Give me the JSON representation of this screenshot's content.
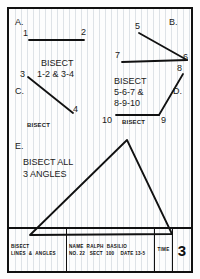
{
  "sheet": {
    "title": "Bisect Lines & Angles Worksheet",
    "grid_color": "#96a5b4",
    "ink_color": "#111111"
  },
  "sections": {
    "a": {
      "letter": "A.",
      "point_start": "1",
      "point_end": "2",
      "line": {
        "x1": 20,
        "y1": 31,
        "x2": 75,
        "y2": 31
      }
    },
    "b": {
      "letter": "B.",
      "point_5": "5",
      "point_6": "6",
      "point_7": "7",
      "ray_5_6": {
        "x1": 130,
        "y1": 24,
        "x2": 178,
        "y2": 51
      },
      "ray_7_6": {
        "x1": 113,
        "y1": 53,
        "x2": 178,
        "y2": 51
      }
    },
    "c": {
      "letter": "C.",
      "point_3": "3",
      "point_4": "4",
      "line": {
        "x1": 19,
        "y1": 68,
        "x2": 64,
        "y2": 104
      }
    },
    "d": {
      "letter": "D.",
      "point_8": "8",
      "point_9": "9",
      "point_10": "10",
      "ray_9_8": {
        "x1": 150,
        "y1": 106,
        "x2": 174,
        "y2": 65
      },
      "ray_9_10": {
        "x1": 150,
        "y1": 106,
        "x2": 107,
        "y2": 106
      }
    },
    "e": {
      "letter": "E.",
      "triangle": {
        "apex": {
          "x": 118,
          "y": 131
        },
        "bottom_left": {
          "x": 21,
          "y": 226
        },
        "bottom_right": {
          "x": 163,
          "y": 225
        }
      }
    }
  },
  "instructions": {
    "ac_line1": "BISECT",
    "ac_line2": "1-2 & 3-4",
    "bd_line1": "BISECT",
    "bd_line2": "5-6-7 &",
    "bd_line3": "8-9-10",
    "c_small": "BISECT",
    "d_small": "BISECT",
    "e_line1": "BISECT ALL",
    "e_line2": "3 ANGLES"
  },
  "title_block": {
    "subject_line1": "BISECT",
    "subject_line2": "LINES  &  ANGLES",
    "name_line1": "NAME  RALPH  BASILIO",
    "name_line2": "NO. 22   SECT  100    DATE 13-5",
    "time_label": "TIME",
    "sheet_number": "3"
  }
}
